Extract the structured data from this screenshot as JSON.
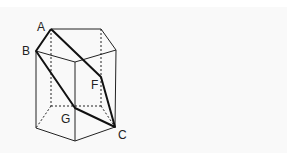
{
  "diagram": {
    "colors": {
      "line": "#222222",
      "background": "#f9f9f9"
    },
    "labels": {
      "A": "A",
      "B": "B",
      "F": "F",
      "G": "G",
      "C": "C"
    },
    "vertices": {
      "A": [
        51,
        29
      ],
      "top_back_right": [
        101,
        29
      ],
      "top_right": [
        116,
        50
      ],
      "top_front": [
        75,
        62
      ],
      "B": [
        36,
        51
      ],
      "bottom_back_left": [
        51,
        106
      ],
      "bottom_back_right": [
        101,
        106
      ],
      "C": [
        115,
        127
      ],
      "bottom_front": [
        75,
        141
      ],
      "bottom_left": [
        36,
        128
      ],
      "G": [
        75,
        108
      ],
      "F": [
        101,
        77
      ]
    },
    "thick_path": [
      "A",
      "F",
      "C",
      "G",
      "B",
      "A"
    ]
  }
}
